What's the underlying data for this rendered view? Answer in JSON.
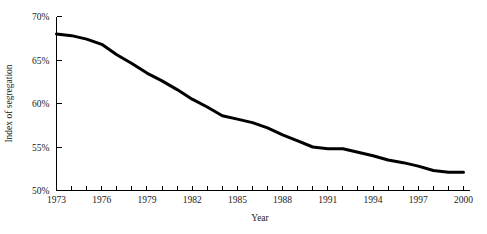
{
  "chart_data": {
    "type": "line",
    "title": "",
    "xlabel": "Year",
    "ylabel": "Index of segregation",
    "xlim": [
      1973,
      2000
    ],
    "ylim": [
      50,
      70
    ],
    "grid": false,
    "legend": null,
    "line_color": "#000000",
    "line_width": 3,
    "x_tick_step": 1,
    "x_label_step": 3,
    "y_tick_step": 5,
    "x_tick_labels": [
      "1973",
      "1976",
      "1979",
      "1982",
      "1985",
      "1988",
      "1991",
      "1994",
      "1997",
      "2000"
    ],
    "x_tick_label_values": [
      1973,
      1976,
      1979,
      1982,
      1985,
      1988,
      1991,
      1994,
      1997,
      2000
    ],
    "y_tick_labels": [
      "50%",
      "55%",
      "60%",
      "65%",
      "70%"
    ],
    "y_tick_label_values": [
      50,
      55,
      60,
      65,
      70
    ],
    "x": [
      1973,
      1974,
      1975,
      1976,
      1977,
      1978,
      1979,
      1980,
      1981,
      1982,
      1983,
      1984,
      1985,
      1986,
      1987,
      1988,
      1989,
      1990,
      1991,
      1992,
      1993,
      1994,
      1995,
      1996,
      1997,
      1998,
      1999,
      2000
    ],
    "values": [
      68.0,
      67.8,
      67.4,
      66.8,
      65.6,
      64.6,
      63.5,
      62.6,
      61.6,
      60.5,
      59.6,
      58.6,
      58.2,
      57.8,
      57.2,
      56.4,
      55.7,
      55.0,
      54.8,
      54.8,
      54.4,
      54.0,
      53.5,
      53.2,
      52.8,
      52.3,
      52.1,
      52.1
    ],
    "series": [
      {
        "name": "Index of segregation",
        "values": [
          68.0,
          67.8,
          67.4,
          66.8,
          65.6,
          64.6,
          63.5,
          62.6,
          61.6,
          60.5,
          59.6,
          58.6,
          58.2,
          57.8,
          57.2,
          56.4,
          55.7,
          55.0,
          54.8,
          54.8,
          54.4,
          54.0,
          53.5,
          53.2,
          52.8,
          52.3,
          52.1,
          52.1
        ]
      }
    ]
  }
}
